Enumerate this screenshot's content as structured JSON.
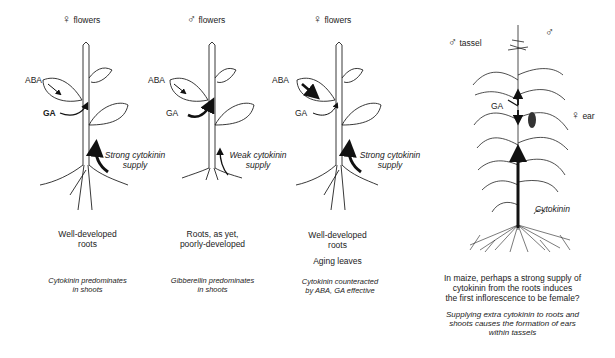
{
  "panels": [
    {
      "header_symbol": "♀",
      "header_text": "flowers",
      "aba_label": "ABA",
      "ga_label": "GA",
      "cytokinin_label_line1": "Strong cytokinin",
      "cytokinin_label_line2": "supply",
      "roots_caption_line1": "Well-developed",
      "roots_caption_line2": "roots",
      "extra_caption": "",
      "effect_line1": "Cytokinin predominates",
      "effect_line2": "in shoots"
    },
    {
      "header_symbol": "♂",
      "header_text": "flowers",
      "aba_label": "ABA",
      "ga_label": "GA",
      "cytokinin_label_line1": "Weak cytokinin",
      "cytokinin_label_line2": "supply",
      "roots_caption_line1": "Roots, as yet,",
      "roots_caption_line2": "poorly-developed",
      "extra_caption": "",
      "effect_line1": "Gibberellin predominates",
      "effect_line2": "in shoots"
    },
    {
      "header_symbol": "♀",
      "header_text": "flowers",
      "aba_label": "ABA",
      "ga_label": "GA",
      "cytokinin_label_line1": "Strong cytokinin",
      "cytokinin_label_line2": "supply",
      "roots_caption_line1": "Well-developed",
      "roots_caption_line2": "roots",
      "extra_caption": "Aging leaves",
      "effect_line1": "Cytokinin counteracted",
      "effect_line2": "by ABA, GA effective"
    }
  ],
  "maize": {
    "tassel_symbol": "♂",
    "tassel_text": "tassel",
    "top_symbol": "♂",
    "ga_label": "GA",
    "ear_symbol": "♀",
    "ear_text": "ear",
    "cytokinin_label": "Cytokinin",
    "question_line1": "In maize, perhaps a strong supply of",
    "question_line2": "cytokinin from the roots induces",
    "question_line3": "the first inflorescence to be female?",
    "note_line1": "Supplying extra cytokinin to roots and",
    "note_line2": "shoots causes the formation of ears",
    "note_line3": "within tassels"
  }
}
